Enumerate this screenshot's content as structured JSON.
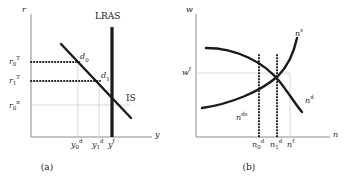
{
  "figure": {
    "panels": [
      {
        "id": "panel-a",
        "caption": "(a)",
        "axes": {
          "y_label": "r",
          "x_label": "y"
        },
        "y_ticks": [
          {
            "name": "r0T",
            "base": "r",
            "sub": "0",
            "sup": "T",
            "value": 0.8
          },
          {
            "name": "r1T",
            "base": "r",
            "sub": "1",
            "sup": "T",
            "value": 0.63
          },
          {
            "name": "r0n",
            "base": "r",
            "sub": "0",
            "sup": "n",
            "value": 0.42
          }
        ],
        "x_ticks": [
          {
            "name": "y0d",
            "base": "y",
            "sub": "0",
            "sup": "d",
            "value": 0.47
          },
          {
            "name": "y1d",
            "base": "y",
            "sub": "1",
            "sup": "d",
            "value": 0.63
          },
          {
            "name": "yf",
            "base": "y",
            "sub": "",
            "sup": "f",
            "value": 0.75
          }
        ],
        "curves": [
          {
            "name": "IS",
            "label": "IS",
            "italic": false,
            "kind": "line"
          },
          {
            "name": "LRAS",
            "label": "LRAS",
            "italic": false,
            "kind": "vertical"
          }
        ],
        "points": [
          {
            "name": "d0",
            "base": "d",
            "sub": "0",
            "sup": ""
          },
          {
            "name": "d1",
            "base": "d",
            "sub": "1",
            "sup": ""
          }
        ]
      },
      {
        "id": "panel-b",
        "caption": "(b)",
        "axes": {
          "y_label": "w",
          "x_label": "n"
        },
        "y_ticks": [
          {
            "name": "wf",
            "base": "w",
            "sub": "",
            "sup": "f",
            "value": 0.6
          }
        ],
        "x_ticks": [
          {
            "name": "n0d",
            "base": "n",
            "sub": "0",
            "sup": "d",
            "value": 0.45
          },
          {
            "name": "n1d",
            "base": "n",
            "sub": "1",
            "sup": "d",
            "value": 0.6
          },
          {
            "name": "nf",
            "base": "n",
            "sub": "",
            "sup": "f",
            "value": 0.72
          }
        ],
        "curves": [
          {
            "name": "ns",
            "base": "n",
            "sub": "",
            "sup": "s",
            "kind": "supply"
          },
          {
            "name": "nd",
            "base": "n",
            "sub": "",
            "sup": "d",
            "kind": "demand"
          }
        ],
        "annotations": [
          {
            "name": "nds",
            "base": "n",
            "sub": "",
            "sup": "ds"
          }
        ]
      }
    ],
    "colors": {
      "ink": "#1a1a1a",
      "axis": "#8a8a8a",
      "guide": "#c8c8c8",
      "background": "#ffffff"
    }
  }
}
